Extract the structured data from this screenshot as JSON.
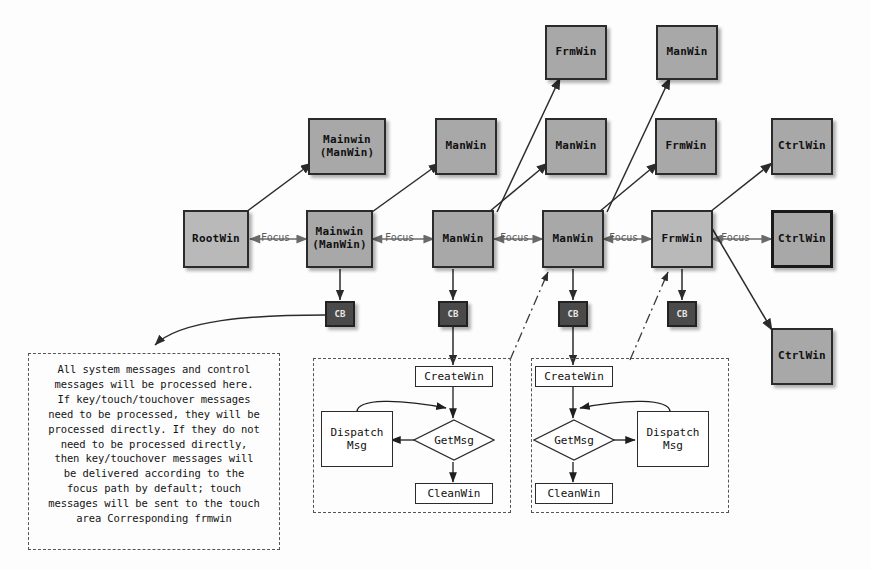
{
  "diagram": {
    "edge_label": "Focus",
    "colors": {
      "node_fill": "#a8a8a8",
      "node_fill_light": "#b9b9b9",
      "node_border": "#2b2b2b",
      "cb_fill": "#4a4a4a",
      "cb_text": "#e8e8e8",
      "line": "#333333",
      "dashed_border": "#555555",
      "background": "#fdfdfd"
    },
    "focus_chain": [
      {
        "id": "rootwin",
        "label": "RootWin"
      },
      {
        "id": "mainwin-manwin",
        "label_line1": "Mainwin",
        "label_line2": "(ManWin)"
      },
      {
        "id": "manwin-1",
        "label": "ManWin"
      },
      {
        "id": "manwin-2",
        "label": "ManWin"
      },
      {
        "id": "frmwin-1",
        "label": "FrmWin"
      },
      {
        "id": "ctrlwin-mid",
        "label": "CtrlWin"
      }
    ],
    "child_nodes": [
      {
        "id": "child-mainwin-manwin",
        "label_line1": "Mainwin",
        "label_line2": "(ManWin)"
      },
      {
        "id": "child-manwin-a",
        "label": "ManWin"
      },
      {
        "id": "child-manwin-b",
        "label": "ManWin"
      },
      {
        "id": "child-frmwin-top",
        "label": "FrmWin"
      },
      {
        "id": "child-frmwin-b",
        "label": "FrmWin"
      },
      {
        "id": "child-manwin-top",
        "label": "ManWin"
      },
      {
        "id": "child-ctrlwin-top",
        "label": "CtrlWin"
      },
      {
        "id": "child-ctrlwin-bottom",
        "label": "CtrlWin"
      }
    ],
    "callback_boxes": [
      {
        "id": "cb-1",
        "label": "CB"
      },
      {
        "id": "cb-2",
        "label": "CB"
      },
      {
        "id": "cb-3",
        "label": "CB"
      },
      {
        "id": "cb-4",
        "label": "CB"
      }
    ],
    "focus_labels": [
      "Focus",
      "Focus",
      "Focus",
      "Focus",
      "Focus"
    ],
    "note": {
      "lines": [
        "All system messages and control",
        "messages will be processed here.",
        "If key/touch/touchover messages",
        "need to be processed, they will be",
        "processed directly. If they do not",
        "need to be processed directly,",
        "then key/touchover messages will",
        "be delivered according to the",
        "focus path by default; touch",
        "messages will be sent to the touch",
        "area Corresponding frmwin"
      ]
    },
    "flow_left": {
      "create": "CreateWin",
      "decision": "GetMsg",
      "dispatch_line1": "Dispatch",
      "dispatch_line2": "Msg",
      "clean": "CleanWin"
    },
    "flow_right": {
      "create": "CreateWin",
      "decision": "GetMsg",
      "dispatch_line1": "Dispatch",
      "dispatch_line2": "Msg",
      "clean": "CleanWin"
    }
  }
}
